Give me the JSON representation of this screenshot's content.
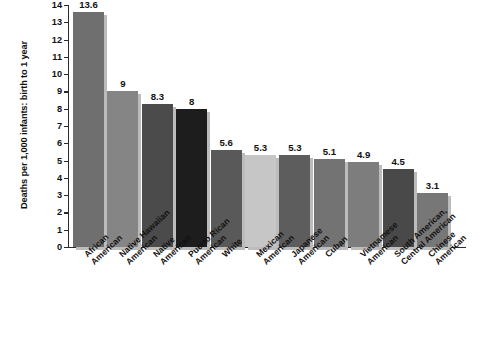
{
  "chart_data": {
    "type": "bar",
    "title": "",
    "xlabel": "",
    "ylabel": "Deaths per 1,000 infants: birth to 1 year",
    "ylim": [
      0,
      14
    ],
    "grid": false,
    "legend": "none",
    "y_ticks": [
      "0",
      "1",
      "2",
      "3",
      "4",
      "5",
      "6",
      "7",
      "8",
      "9",
      "10",
      "11",
      "12",
      "13",
      "14"
    ],
    "categories": [
      "African American",
      "Native Hawaiian American",
      "Native American",
      "Puerto Rican American",
      "White",
      "Mexican American",
      "Japanese American",
      "Cuban",
      "Vietnamese American",
      "South American, Central American",
      "Chinese American"
    ],
    "category_lines": [
      [
        "African",
        "American"
      ],
      [
        "Native Hawaiian",
        "American"
      ],
      [
        "Native",
        "American"
      ],
      [
        "Puerto Rican",
        "American"
      ],
      [
        "White",
        ""
      ],
      [
        "Mexican",
        "American"
      ],
      [
        "Japanese",
        "American"
      ],
      [
        "Cuban",
        ""
      ],
      [
        "Vietnamese",
        "American"
      ],
      [
        "South American,",
        "Central American"
      ],
      [
        "Chinese",
        "American"
      ]
    ],
    "values": [
      13.6,
      9,
      8.3,
      8,
      5.6,
      5.3,
      5.3,
      5.1,
      4.9,
      4.5,
      3.1
    ],
    "value_labels": [
      "13.6",
      "9",
      "8.3",
      "8",
      "5.6",
      "5.3",
      "5.3",
      "5.1",
      "4.9",
      "4.5",
      "3.1"
    ],
    "bar_colors": [
      "#6f6f6f",
      "#858585",
      "#4b4b4b",
      "#1d1d1d",
      "#595959",
      "#c6c6c6",
      "#5d5d5d",
      "#737373",
      "#7d7d7d",
      "#494949",
      "#777777"
    ],
    "shadow_color": "#bcbcbc"
  }
}
